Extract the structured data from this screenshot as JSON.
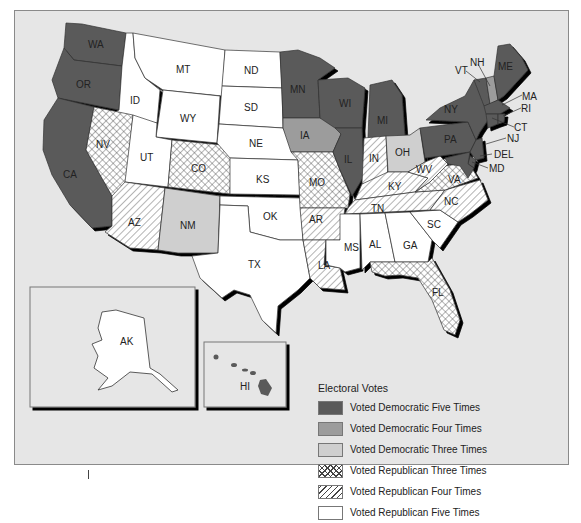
{
  "map": {
    "title": "US Presidential Election Voting Patterns by State",
    "colors": {
      "background": "#e6e6e6",
      "dem5": "#5a5a5a",
      "dem4": "#9c9c9c",
      "dem3": "#cfcfcf",
      "rep5": "#ffffff",
      "border": "#333333"
    },
    "states": [
      {
        "abbr": "WA",
        "category": "dem5"
      },
      {
        "abbr": "OR",
        "category": "dem5"
      },
      {
        "abbr": "CA",
        "category": "dem5"
      },
      {
        "abbr": "ID",
        "category": "rep5"
      },
      {
        "abbr": "MT",
        "category": "rep5"
      },
      {
        "abbr": "ND",
        "category": "rep5"
      },
      {
        "abbr": "SD",
        "category": "rep5"
      },
      {
        "abbr": "WY",
        "category": "rep5"
      },
      {
        "abbr": "NE",
        "category": "rep5"
      },
      {
        "abbr": "UT",
        "category": "rep5"
      },
      {
        "abbr": "KS",
        "category": "rep5"
      },
      {
        "abbr": "OK",
        "category": "rep5"
      },
      {
        "abbr": "TX",
        "category": "rep5"
      },
      {
        "abbr": "MS",
        "category": "rep5"
      },
      {
        "abbr": "AL",
        "category": "rep5"
      },
      {
        "abbr": "GA",
        "category": "rep5"
      },
      {
        "abbr": "SC",
        "category": "rep5"
      },
      {
        "abbr": "AK",
        "category": "rep5"
      },
      {
        "abbr": "NV",
        "category": "rep3"
      },
      {
        "abbr": "CO",
        "category": "rep3"
      },
      {
        "abbr": "MO",
        "category": "rep3"
      },
      {
        "abbr": "VA",
        "category": "rep3"
      },
      {
        "abbr": "FL",
        "category": "rep3"
      },
      {
        "abbr": "AZ",
        "category": "rep4"
      },
      {
        "abbr": "AR",
        "category": "rep4"
      },
      {
        "abbr": "LA",
        "category": "rep4"
      },
      {
        "abbr": "IN",
        "category": "rep4"
      },
      {
        "abbr": "KY",
        "category": "rep4"
      },
      {
        "abbr": "TN",
        "category": "rep4"
      },
      {
        "abbr": "NC",
        "category": "rep4"
      },
      {
        "abbr": "WV",
        "category": "rep4"
      },
      {
        "abbr": "NM",
        "category": "dem3"
      },
      {
        "abbr": "OH",
        "category": "dem3"
      },
      {
        "abbr": "IA",
        "category": "dem4"
      },
      {
        "abbr": "NH",
        "category": "dem4"
      },
      {
        "abbr": "MN",
        "category": "dem5"
      },
      {
        "abbr": "WI",
        "category": "dem5"
      },
      {
        "abbr": "MI",
        "category": "dem5"
      },
      {
        "abbr": "IL",
        "category": "dem5"
      },
      {
        "abbr": "NY",
        "category": "dem5"
      },
      {
        "abbr": "PA",
        "category": "dem5"
      },
      {
        "abbr": "VT",
        "category": "dem5"
      },
      {
        "abbr": "ME",
        "category": "dem5"
      },
      {
        "abbr": "MA",
        "category": "dem5"
      },
      {
        "abbr": "RI",
        "category": "dem5"
      },
      {
        "abbr": "CT",
        "category": "dem5"
      },
      {
        "abbr": "NJ",
        "category": "dem5"
      },
      {
        "abbr": "DEL",
        "category": "dem5"
      },
      {
        "abbr": "MD",
        "category": "dem5"
      },
      {
        "abbr": "HI",
        "category": "dem5"
      }
    ]
  },
  "legend": {
    "title": "Electoral Votes",
    "items": [
      {
        "label": "Voted Democratic Five Times",
        "category": "dem5"
      },
      {
        "label": "Voted Democratic Four Times",
        "category": "dem4"
      },
      {
        "label": "Voted Democratic Three Times",
        "category": "dem3"
      },
      {
        "label": "Voted Republican Three Times",
        "category": "rep3"
      },
      {
        "label": "Voted Republican Four Times",
        "category": "rep4"
      },
      {
        "label": "Voted Republican Five Times",
        "category": "rep5"
      }
    ]
  }
}
